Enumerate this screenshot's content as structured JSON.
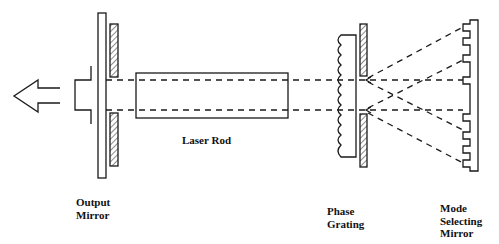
{
  "diagram": {
    "stroke_color": "#1a1a1a",
    "background": "#ffffff",
    "components": [
      {
        "id": "output-arrow",
        "type": "arrow",
        "direction": "left"
      },
      {
        "id": "output-mirror",
        "type": "mirror-plate"
      },
      {
        "id": "aperture-left",
        "type": "hatched-aperture"
      },
      {
        "id": "laser-rod",
        "type": "rectangle"
      },
      {
        "id": "phase-grating",
        "type": "grating"
      },
      {
        "id": "aperture-right",
        "type": "hatched-aperture"
      },
      {
        "id": "mode-selecting-mirror",
        "type": "stepped-mirror"
      }
    ]
  },
  "labels": {
    "output_mirror": [
      "Output",
      "Mirror"
    ],
    "laser_rod": "Laser Rod",
    "phase_grating": [
      "Phase",
      "Grating"
    ],
    "mode_selecting_mirror": [
      "Mode",
      "Selecting",
      "Mirror"
    ]
  }
}
